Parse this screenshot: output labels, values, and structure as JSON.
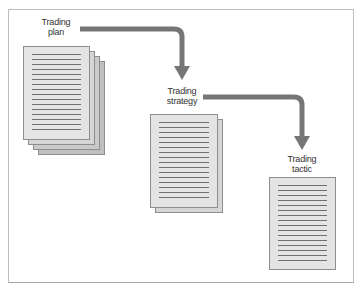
{
  "diagram": {
    "type": "flow",
    "colors": {
      "arrow": "#767676",
      "page": "#e4e4e4",
      "page_border": "#8e8e8e",
      "text_line": "#6f6f6f"
    },
    "nodes": [
      {
        "id": "plan",
        "label_line1": "Trading",
        "label_line2": "plan",
        "pages": 4
      },
      {
        "id": "strategy",
        "label_line1": "Trading",
        "label_line2": "strategy",
        "pages": 2
      },
      {
        "id": "tactic",
        "label_line1": "Trading",
        "label_line2": "tactic",
        "pages": 1
      }
    ],
    "edges": [
      {
        "from": "plan",
        "to": "strategy"
      },
      {
        "from": "strategy",
        "to": "tactic"
      }
    ]
  }
}
